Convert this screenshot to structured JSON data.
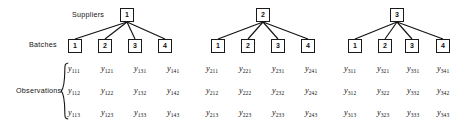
{
  "figure": {
    "type": "hierarchical-tree-diagram",
    "background_color": "#ffffff",
    "line_color": "#121212",
    "row_labels": {
      "suppliers": "Suppliers",
      "batches": "Batches",
      "observations": "Observations"
    }
  },
  "suppliers": [
    {
      "label": "1",
      "batches": [
        {
          "label": "1",
          "observations": [
            "y111",
            "y112",
            "y113"
          ]
        },
        {
          "label": "2",
          "observations": [
            "y121",
            "y122",
            "y123"
          ]
        },
        {
          "label": "3",
          "observations": [
            "y131",
            "y132",
            "y133"
          ]
        },
        {
          "label": "4",
          "observations": [
            "y141",
            "y142",
            "y143"
          ]
        }
      ]
    },
    {
      "label": "2",
      "batches": [
        {
          "label": "1",
          "observations": [
            "y211",
            "y212",
            "y213"
          ]
        },
        {
          "label": "2",
          "observations": [
            "y221",
            "y222",
            "y223"
          ]
        },
        {
          "label": "3",
          "observations": [
            "y231",
            "y232",
            "y233"
          ]
        },
        {
          "label": "4",
          "observations": [
            "y241",
            "y242",
            "y243"
          ]
        }
      ]
    },
    {
      "label": "3",
      "batches": [
        {
          "label": "1",
          "observations": [
            "y311",
            "y312",
            "y313"
          ]
        },
        {
          "label": "2",
          "observations": [
            "y321",
            "y322",
            "y323"
          ]
        },
        {
          "label": "3",
          "observations": [
            "y331",
            "y332",
            "y333"
          ]
        },
        {
          "label": "4",
          "observations": [
            "y341",
            "y342",
            "y343"
          ]
        }
      ]
    }
  ],
  "observation_rows": [
    {
      "index": 1,
      "cells": [
        "y111",
        "y121",
        "y131",
        "y141",
        "y211",
        "y221",
        "y231",
        "y241",
        "y311",
        "y321",
        "y331",
        "y341"
      ]
    },
    {
      "index": 2,
      "cells": [
        "y112",
        "y122",
        "y132",
        "y142",
        "y212",
        "y222",
        "y232",
        "y242",
        "y312",
        "y322",
        "y332",
        "y342"
      ]
    },
    {
      "index": 3,
      "cells": [
        "y113",
        "y123",
        "y133",
        "y143",
        "y213",
        "y223",
        "y233",
        "y243",
        "y313",
        "y323",
        "y333",
        "y343"
      ]
    }
  ],
  "supplier_box_labels": [
    "1",
    "2",
    "3"
  ],
  "batch_box_labels": [
    "1",
    "2",
    "3",
    "4",
    "1",
    "2",
    "3",
    "4",
    "1",
    "2",
    "3",
    "4"
  ]
}
